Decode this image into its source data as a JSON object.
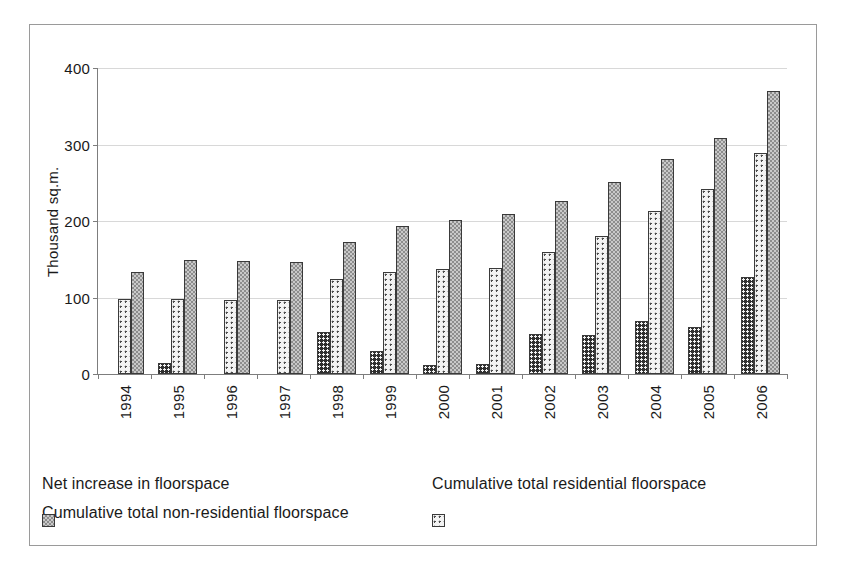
{
  "chart_data": {
    "type": "bar",
    "title": "",
    "xlabel": "",
    "ylabel": "Thousand sq.m.",
    "ylim": [
      0,
      400
    ],
    "yticks": [
      0,
      100,
      200,
      300,
      400
    ],
    "grid": true,
    "legend_position": "bottom",
    "categories": [
      "1994",
      "1995",
      "1996",
      "1997",
      "1998",
      "1999",
      "2000",
      "2001",
      "2002",
      "2003",
      "2004",
      "2005",
      "2006"
    ],
    "series": [
      {
        "name": "Net increase in floorspace",
        "pattern": "dark-dotted",
        "color": "#2f2f2f",
        "values": [
          0,
          15,
          0,
          0,
          55,
          30,
          12,
          13,
          52,
          51,
          69,
          61,
          127
        ]
      },
      {
        "name": "Cumulative total residential floorspace",
        "pattern": "light-dotted",
        "color": "#f3f3f3",
        "values": [
          98,
          98,
          97,
          97,
          124,
          134,
          137,
          139,
          160,
          181,
          213,
          242,
          289
        ]
      },
      {
        "name": "Cumulative total non-residential floorspace",
        "pattern": "gray-checker",
        "color": "#c9c9c9",
        "values": [
          133,
          149,
          148,
          147,
          172,
          193,
          201,
          209,
          226,
          251,
          281,
          309,
          370
        ]
      }
    ]
  },
  "legend": {
    "items": [
      "Net increase in floorspace",
      "Cumulative total residential floorspace",
      "Cumulative total non-residential floorspace"
    ]
  }
}
